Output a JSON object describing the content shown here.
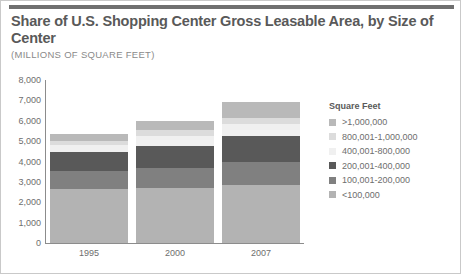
{
  "figure": {
    "title": "Share of U.S. Shopping Center Gross Leasable Area, by Size of Center",
    "subtitle": "(MILLIONS OF SQUARE FEET)"
  },
  "legend": {
    "title": "Square Feet"
  },
  "chart_data": {
    "type": "bar",
    "stacked": true,
    "title": "Share of U.S. Shopping Center Gross Leasable Area, by Size of Center",
    "subtitle": "(MILLIONS OF SQUARE FEET)",
    "xlabel": "",
    "ylabel": "",
    "ylim": [
      0,
      8000
    ],
    "yticks": [
      "8,000",
      "7,000",
      "6,000",
      "5,000",
      "4,000",
      "3,000",
      "2,000",
      "1,000",
      "0"
    ],
    "ytick_values": [
      8000,
      7000,
      6000,
      5000,
      4000,
      3000,
      2000,
      1000,
      0
    ],
    "grid": false,
    "legend_position": "right",
    "categories": [
      "1995",
      "2000",
      "2007"
    ],
    "series": [
      {
        "name": "<100,000",
        "color": "#b3b3b3",
        "values": [
          2650,
          2700,
          2850
        ]
      },
      {
        "name": "100,001-200,000",
        "color": "#808080",
        "values": [
          900,
          1000,
          1150
        ]
      },
      {
        "name": "200,001-400,000",
        "color": "#595959",
        "values": [
          900,
          1050,
          1250
        ]
      },
      {
        "name": "400,001-800,000",
        "color": "#f0f0f0",
        "values": [
          350,
          500,
          600
        ]
      },
      {
        "name": "800,001-1,000,000",
        "color": "#dcdcdc",
        "values": [
          200,
          300,
          300
        ]
      },
      {
        "name": ">1,000,000",
        "color": "#b9b9b9",
        "values": [
          350,
          450,
          750
        ]
      }
    ],
    "totals": [
      5350,
      6000,
      6900
    ]
  }
}
